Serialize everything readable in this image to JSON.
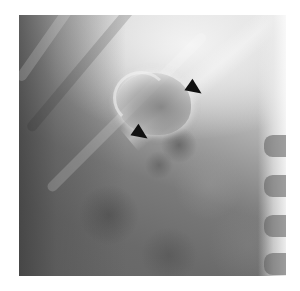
{
  "figure": {
    "type": "radiograph",
    "annotations": [
      {
        "name": "arrow-upper",
        "label": "arrow"
      },
      {
        "name": "arrow-lower",
        "label": "arrow"
      }
    ],
    "colors": {
      "background": "#ffffff",
      "arrow": "#111111"
    }
  }
}
